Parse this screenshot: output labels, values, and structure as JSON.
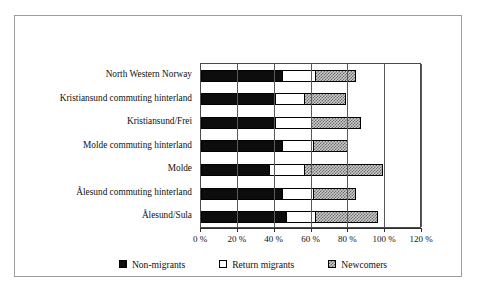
{
  "figure": {
    "caption_fragment": ""
  },
  "legend": {
    "position": "bottom",
    "items": [
      {
        "label": "Non-migrants",
        "key": "nonmig",
        "color": "#0d0d0d"
      },
      {
        "label": "Return migrants",
        "key": "ret",
        "color": "#ffffff"
      },
      {
        "label": "Newcomers",
        "key": "newc",
        "color": "#c9c9c9"
      }
    ]
  },
  "chart_data": {
    "type": "bar",
    "orientation": "horizontal",
    "stacked": true,
    "title": "",
    "subtitle": "",
    "xlabel": "",
    "ylabel": "",
    "xlim": [
      0,
      120
    ],
    "xticks": [
      0,
      20,
      40,
      60,
      80,
      100,
      120
    ],
    "xtick_labels": [
      "0 %",
      "20 %",
      "40 %",
      "60 %",
      "80 %",
      "100 %",
      "120 %"
    ],
    "grid": true,
    "grid_axis": "x",
    "legend_entries": [
      "Non-migrants",
      "Return migrants",
      "Newcomers"
    ],
    "categories": [
      "North Western Norway",
      "Kristiansund commuting hinterland",
      "Kristiansund/Frei",
      "Molde commuting hinterland",
      "Molde",
      "Ålesund commuting hinterland",
      "Ålesund/Sula"
    ],
    "series": [
      {
        "name": "Non-migrants",
        "values": [
          44,
          40,
          40,
          44,
          37,
          44,
          46
        ]
      },
      {
        "name": "Return migrants",
        "values": [
          18,
          16,
          20,
          17,
          19,
          17,
          16
        ]
      },
      {
        "name": "Newcomers",
        "values": [
          22,
          23,
          27,
          19,
          43,
          23,
          34
        ]
      }
    ],
    "totals": [
      84,
      79,
      87,
      80,
      99,
      84,
      96
    ],
    "annotations": []
  }
}
